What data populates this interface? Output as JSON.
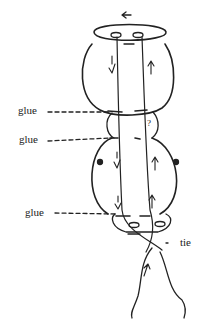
{
  "diagram": {
    "type": "hand-drawn sketch",
    "labels": {
      "glue_top": "glue",
      "glue_middle": "glue",
      "glue_bottom": "glue",
      "tie": "tie"
    },
    "arrows": {
      "top_cap": "<-",
      "question_mark": "?"
    },
    "colors": {
      "ink": "#222222",
      "background": "#ffffff"
    }
  }
}
